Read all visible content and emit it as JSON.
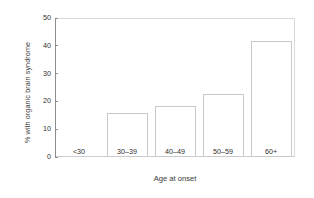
{
  "chart_data": {
    "type": "bar",
    "title": "",
    "subtitle": "",
    "xlabel": "Age at onset",
    "ylabel": "% with organic brain syndrome",
    "categories": [
      "<30",
      "30–39",
      "40–49",
      "50–59",
      "60+"
    ],
    "values": [
      0,
      15.8,
      18.2,
      22.7,
      41.8
    ],
    "series": [
      {
        "name": "% with organic brain syndrome",
        "values": [
          0,
          15.8,
          18.2,
          22.7,
          41.8
        ]
      }
    ],
    "ylim": [
      0,
      50
    ],
    "yticks": [
      0,
      10,
      20,
      30,
      40,
      50
    ],
    "ytick_labels": [
      "0",
      "10",
      "20",
      "30",
      "40",
      "50"
    ],
    "xlim_categories": 5,
    "grid": false,
    "legend": false,
    "legend_position": "none",
    "bar_face_color": "#ffffff",
    "bar_edge_color": "#c9c9c9",
    "axis_color": "#8d8d8d",
    "text_color": "#2e2e2e",
    "background_color": "#ffffff",
    "annotations": []
  }
}
